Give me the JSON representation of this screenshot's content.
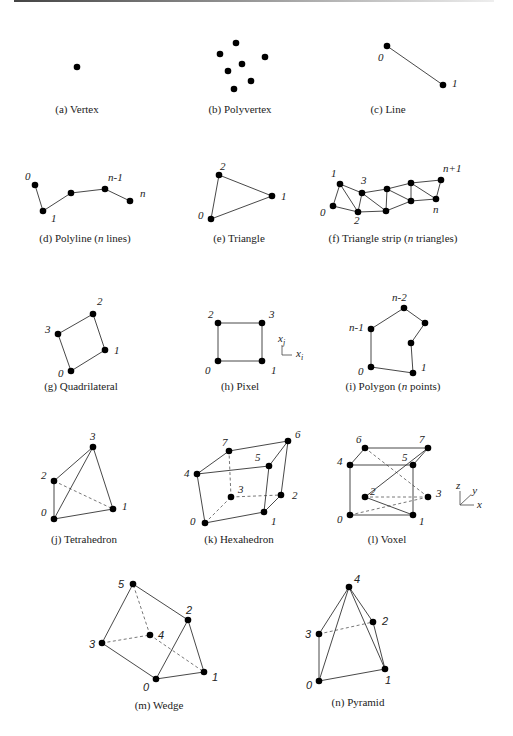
{
  "cells": [
    {
      "id": "vertex",
      "caption_prefix": "(a) Vertex",
      "caption_italic": "",
      "caption_suffix": "",
      "cx": 77,
      "cy": 113,
      "vertices": [
        [
          77,
          67
        ]
      ],
      "edges": [],
      "hidden": [],
      "labels": [],
      "serif": true
    },
    {
      "id": "polyvertex",
      "caption_prefix": "(b) Polyvertex",
      "caption_italic": "",
      "caption_suffix": "",
      "cx": 240,
      "cy": 113,
      "vertices": [
        [
          236,
          43
        ],
        [
          220,
          54
        ],
        [
          265,
          57
        ],
        [
          242,
          64
        ],
        [
          228,
          71
        ],
        [
          251,
          81
        ],
        [
          234,
          89
        ]
      ],
      "edges": [],
      "hidden": [],
      "labels": [],
      "serif": true
    },
    {
      "id": "line",
      "caption_prefix": "(c) Line",
      "caption_italic": "",
      "caption_suffix": "",
      "cx": 388,
      "cy": 113,
      "vertices": [
        [
          387,
          46
        ],
        [
          443,
          85
        ]
      ],
      "edges": [
        [
          0,
          1
        ]
      ],
      "hidden": [],
      "labels": [
        {
          "t": "0",
          "x": 378,
          "y": 61
        },
        {
          "t": "1",
          "x": 452,
          "y": 87
        }
      ],
      "serif": true
    },
    {
      "id": "polyline",
      "caption_prefix": "(d) Polyline (",
      "caption_italic": "n",
      "caption_suffix": " lines)",
      "cx": 85,
      "cy": 242,
      "vertices": [
        [
          35,
          185
        ],
        [
          43,
          211
        ],
        [
          71,
          193
        ],
        [
          105,
          189
        ],
        [
          130,
          201
        ]
      ],
      "edges": [
        [
          0,
          1
        ],
        [
          1,
          2
        ],
        [
          2,
          3
        ],
        [
          3,
          4
        ]
      ],
      "hidden": [],
      "labels": [
        {
          "t": "0",
          "x": 25,
          "y": 180
        },
        {
          "t": "1",
          "x": 51,
          "y": 222
        },
        {
          "t": "n-1",
          "x": 108,
          "y": 181
        },
        {
          "t": "n",
          "x": 140,
          "y": 197
        }
      ],
      "serif": true
    },
    {
      "id": "triangle",
      "caption_prefix": "(e) Triangle",
      "caption_italic": "",
      "caption_suffix": "",
      "cx": 239,
      "cy": 242,
      "vertices": [
        [
          219,
          175
        ],
        [
          272,
          196
        ],
        [
          211,
          219
        ]
      ],
      "edges": [
        [
          0,
          1
        ],
        [
          1,
          2
        ],
        [
          2,
          0
        ]
      ],
      "hidden": [],
      "labels": [
        {
          "t": "2",
          "x": 220,
          "y": 170
        },
        {
          "t": "1",
          "x": 281,
          "y": 200
        },
        {
          "t": "0",
          "x": 198,
          "y": 219
        }
      ],
      "serif": true
    },
    {
      "id": "triangle-strip",
      "caption_prefix": "(f) Triangle strip (",
      "caption_italic": "n",
      "caption_suffix": " triangles)",
      "cx": 393,
      "cy": 242,
      "vertices": [
        [
          333,
          206
        ],
        [
          340,
          184
        ],
        [
          358,
          212
        ],
        [
          362,
          193
        ],
        [
          386,
          211
        ],
        [
          387,
          189
        ],
        [
          411,
          201
        ],
        [
          411,
          183
        ],
        [
          436,
          199
        ],
        [
          441,
          180
        ]
      ],
      "edges": [
        [
          0,
          1
        ],
        [
          0,
          2
        ],
        [
          1,
          2
        ],
        [
          1,
          3
        ],
        [
          2,
          3
        ],
        [
          2,
          4
        ],
        [
          3,
          4
        ],
        [
          3,
          5
        ],
        [
          4,
          5
        ],
        [
          4,
          6
        ],
        [
          5,
          6
        ],
        [
          5,
          7
        ],
        [
          6,
          7
        ],
        [
          6,
          8
        ],
        [
          7,
          8
        ],
        [
          7,
          9
        ],
        [
          8,
          9
        ]
      ],
      "hidden": [],
      "labels": [
        {
          "t": "1",
          "x": 331,
          "y": 177
        },
        {
          "t": "3",
          "x": 361,
          "y": 184
        },
        {
          "t": "0",
          "x": 320,
          "y": 216
        },
        {
          "t": "2",
          "x": 354,
          "y": 224
        },
        {
          "t": "n+1",
          "x": 443,
          "y": 172
        },
        {
          "t": "n",
          "x": 433,
          "y": 213
        }
      ],
      "serif": true
    },
    {
      "id": "quadrilateral",
      "caption_prefix": "(g) Quadrilateral",
      "caption_italic": "",
      "caption_suffix": "",
      "cx": 81,
      "cy": 390,
      "vertices": [
        [
          71,
          371
        ],
        [
          105,
          350
        ],
        [
          93,
          314
        ],
        [
          58,
          334
        ]
      ],
      "edges": [
        [
          0,
          1
        ],
        [
          1,
          2
        ],
        [
          2,
          3
        ],
        [
          3,
          0
        ]
      ],
      "hidden": [],
      "labels": [
        {
          "t": "0",
          "x": 58,
          "y": 377
        },
        {
          "t": "1",
          "x": 114,
          "y": 354
        },
        {
          "t": "2",
          "x": 97,
          "y": 305
        },
        {
          "t": "3",
          "x": 45,
          "y": 333
        }
      ],
      "serif": true
    },
    {
      "id": "pixel",
      "caption_prefix": "(h) Pixel",
      "caption_italic": "",
      "caption_suffix": "",
      "cx": 240,
      "cy": 390,
      "vertices": [
        [
          218,
          361
        ],
        [
          262,
          361
        ],
        [
          218,
          323
        ],
        [
          262,
          323
        ]
      ],
      "edges": [
        [
          0,
          1
        ],
        [
          1,
          3
        ],
        [
          3,
          2
        ],
        [
          2,
          0
        ]
      ],
      "hidden": [],
      "labels": [
        {
          "t": "0",
          "x": 205,
          "y": 374
        },
        {
          "t": "1",
          "x": 271,
          "y": 374
        },
        {
          "t": "2",
          "x": 208,
          "y": 318
        },
        {
          "t": "3",
          "x": 269,
          "y": 318
        }
      ],
      "axes": {
        "ox": 282,
        "oy": 355,
        "len": 10,
        "xlabel": "x",
        "xsub": "i",
        "ylabel": "x",
        "ysub": "j"
      },
      "serif": true
    },
    {
      "id": "polygon",
      "caption_prefix": "(i) Polygon (",
      "caption_italic": "n",
      "caption_suffix": " points)",
      "cx": 393,
      "cy": 390,
      "vertices": [
        [
          371,
          367
        ],
        [
          413,
          373
        ],
        [
          411,
          343
        ],
        [
          425,
          323
        ],
        [
          404,
          308
        ],
        [
          371,
          329
        ]
      ],
      "edges": [
        [
          0,
          1
        ],
        [
          1,
          2
        ],
        [
          2,
          3
        ],
        [
          3,
          4
        ],
        [
          4,
          5
        ],
        [
          5,
          0
        ]
      ],
      "hidden": [],
      "labels": [
        {
          "t": "0",
          "x": 358,
          "y": 375
        },
        {
          "t": "1",
          "x": 421,
          "y": 371
        },
        {
          "t": "n-2",
          "x": 392,
          "y": 301
        },
        {
          "t": "n-1",
          "x": 349,
          "y": 331
        }
      ],
      "serif": true
    },
    {
      "id": "tetrahedron",
      "caption_prefix": "(j) Tetrahedron",
      "caption_italic": "",
      "caption_suffix": "",
      "cx": 84,
      "cy": 543,
      "vertices": [
        [
          54,
          519
        ],
        [
          113,
          509
        ],
        [
          54,
          481
        ],
        [
          93,
          447
        ]
      ],
      "edges": [
        [
          0,
          1
        ],
        [
          0,
          2
        ],
        [
          0,
          3
        ],
        [
          2,
          3
        ],
        [
          3,
          1
        ]
      ],
      "hidden": [
        [
          2,
          1
        ]
      ],
      "labels": [
        {
          "t": "0",
          "x": 41,
          "y": 516
        },
        {
          "t": "1",
          "x": 122,
          "y": 510
        },
        {
          "t": "2",
          "x": 41,
          "y": 479
        },
        {
          "t": "3",
          "x": 90,
          "y": 440
        }
      ],
      "serif": true
    },
    {
      "id": "hexahedron",
      "caption_prefix": "(k) Hexahedron",
      "caption_italic": "",
      "caption_suffix": "",
      "cx": 239,
      "cy": 543,
      "vertices": [
        [
          205,
          523
        ],
        [
          264,
          512
        ],
        [
          281,
          495
        ],
        [
          231,
          497
        ],
        [
          197,
          474
        ],
        [
          269,
          466
        ],
        [
          288,
          441
        ],
        [
          229,
          451
        ]
      ],
      "edges": [
        [
          0,
          1
        ],
        [
          1,
          2
        ],
        [
          0,
          4
        ],
        [
          1,
          5
        ],
        [
          2,
          6
        ],
        [
          4,
          5
        ],
        [
          5,
          6
        ],
        [
          6,
          7
        ],
        [
          7,
          4
        ]
      ],
      "hidden": [
        [
          0,
          3
        ],
        [
          3,
          2
        ],
        [
          3,
          7
        ]
      ],
      "labels": [
        {
          "t": "0",
          "x": 190,
          "y": 525
        },
        {
          "t": "1",
          "x": 271,
          "y": 525
        },
        {
          "t": "2",
          "x": 292,
          "y": 499
        },
        {
          "t": "3",
          "x": 238,
          "y": 493
        },
        {
          "t": "4",
          "x": 184,
          "y": 477
        },
        {
          "t": "5",
          "x": 255,
          "y": 461
        },
        {
          "t": "6",
          "x": 295,
          "y": 438
        },
        {
          "t": "7",
          "x": 222,
          "y": 446
        }
      ],
      "serif": true
    },
    {
      "id": "voxel",
      "caption_prefix": "(l) Voxel",
      "caption_italic": "",
      "caption_suffix": "",
      "cx": 387,
      "cy": 543,
      "vertices": [
        [
          350,
          515
        ],
        [
          413,
          515
        ],
        [
          428,
          497
        ],
        [
          365,
          497
        ],
        [
          350,
          465
        ],
        [
          413,
          465
        ],
        [
          365,
          448
        ],
        [
          428,
          448
        ]
      ],
      "edges": [
        [
          0,
          1
        ],
        [
          0,
          4
        ],
        [
          1,
          5
        ],
        [
          1,
          3
        ],
        [
          3,
          7
        ],
        [
          4,
          5
        ],
        [
          4,
          6
        ],
        [
          5,
          7
        ],
        [
          6,
          7
        ]
      ],
      "hidden": [
        [
          0,
          2
        ],
        [
          2,
          3
        ],
        [
          2,
          6
        ]
      ],
      "labels": [
        {
          "t": "0",
          "x": 337,
          "y": 523
        },
        {
          "t": "1",
          "x": 419,
          "y": 525
        },
        {
          "t": "2",
          "x": 370,
          "y": 495
        },
        {
          "t": "3",
          "x": 436,
          "y": 497
        },
        {
          "t": "4",
          "x": 337,
          "y": 465
        },
        {
          "t": "5",
          "x": 402,
          "y": 461
        },
        {
          "t": "6",
          "x": 356,
          "y": 443
        },
        {
          "t": "7",
          "x": 419,
          "y": 443
        }
      ],
      "axes3d": {
        "ox": 460,
        "oy": 505,
        "len": 14,
        "x": "x",
        "y": "y",
        "z": "z"
      },
      "serif": true
    },
    {
      "id": "wedge",
      "caption_prefix": "(m) Wedge",
      "caption_italic": "",
      "caption_suffix": "",
      "cx": 159,
      "cy": 709,
      "vertices": [
        [
          156,
          679
        ],
        [
          204,
          672
        ],
        [
          188,
          620
        ],
        [
          102,
          643
        ],
        [
          150,
          635
        ],
        [
          133,
          584
        ]
      ],
      "edges": [
        [
          0,
          1
        ],
        [
          1,
          2
        ],
        [
          2,
          0
        ],
        [
          0,
          3
        ],
        [
          3,
          5
        ],
        [
          5,
          2
        ]
      ],
      "hidden": [
        [
          3,
          4
        ],
        [
          4,
          1
        ],
        [
          4,
          5
        ]
      ],
      "labels": [
        {
          "t": "0",
          "x": 143,
          "y": 691
        },
        {
          "t": "1",
          "x": 212,
          "y": 681
        },
        {
          "t": "2",
          "x": 186,
          "y": 614
        },
        {
          "t": "3",
          "x": 89,
          "y": 648
        },
        {
          "t": "4",
          "x": 158,
          "y": 639
        },
        {
          "t": "5",
          "x": 118,
          "y": 588
        }
      ],
      "serif": false
    },
    {
      "id": "pyramid",
      "caption_prefix": "(n) Pyramid",
      "caption_italic": "",
      "caption_suffix": "",
      "cx": 358,
      "cy": 706,
      "vertices": [
        [
          319,
          681
        ],
        [
          385,
          669
        ],
        [
          373,
          622
        ],
        [
          319,
          634
        ],
        [
          349,
          587
        ]
      ],
      "edges": [
        [
          0,
          1
        ],
        [
          0,
          3
        ],
        [
          0,
          4
        ],
        [
          1,
          4
        ],
        [
          3,
          4
        ],
        [
          2,
          4
        ],
        [
          1,
          2
        ]
      ],
      "hidden": [
        [
          3,
          2
        ]
      ],
      "labels": [
        {
          "t": "0",
          "x": 306,
          "y": 689
        },
        {
          "t": "1",
          "x": 385,
          "y": 684
        },
        {
          "t": "2",
          "x": 382,
          "y": 625
        },
        {
          "t": "3",
          "x": 305,
          "y": 638
        },
        {
          "t": "4",
          "x": 354,
          "y": 583
        }
      ],
      "serif": false
    }
  ],
  "style": {
    "vertex_radius": 3.3,
    "ink": "#000000",
    "edge_color": "#333333",
    "background": "#ffffff"
  }
}
